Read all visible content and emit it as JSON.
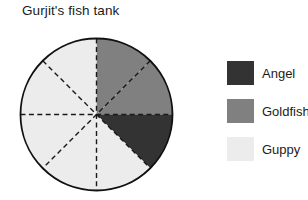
{
  "chart_data": {
    "type": "pie",
    "title": "Gurjit's fish tank",
    "categories": [
      "Angel",
      "Goldfish",
      "Guppy"
    ],
    "values": [
      1,
      2,
      5
    ],
    "total_slices": 8,
    "slice_angle_degrees": 45,
    "fractions": [
      "1/8",
      "2/8",
      "5/8"
    ],
    "colors": [
      "#333333",
      "#808080",
      "#ececec"
    ],
    "outline_color": "#111111",
    "divider_style": "dashed",
    "divider_color": "#1a1a1a",
    "legend_position": "right",
    "grid": false,
    "slices": [
      {
        "label": "Guppy",
        "start_deg": 270,
        "end_deg": 315,
        "color": "#ececec"
      },
      {
        "label": "Goldfish",
        "start_deg": 315,
        "end_deg": 0,
        "color": "#808080"
      },
      {
        "label": "Goldfish",
        "start_deg": 0,
        "end_deg": 45,
        "color": "#808080"
      },
      {
        "label": "Angel",
        "start_deg": 45,
        "end_deg": 90,
        "color": "#333333"
      },
      {
        "label": "Guppy",
        "start_deg": 90,
        "end_deg": 135,
        "color": "#ececec"
      },
      {
        "label": "Guppy",
        "start_deg": 135,
        "end_deg": 180,
        "color": "#ececec"
      },
      {
        "label": "Guppy",
        "start_deg": 180,
        "end_deg": 225,
        "color": "#ececec"
      },
      {
        "label": "Guppy",
        "start_deg": 225,
        "end_deg": 270,
        "color": "#ececec"
      }
    ]
  },
  "title": {
    "text": "Gurjit's fish tank"
  },
  "legend": {
    "items": [
      {
        "label": "Angel",
        "color": "#333333"
      },
      {
        "label": "Goldfish",
        "color": "#808080"
      },
      {
        "label": "Guppy",
        "color": "#ececec"
      }
    ]
  }
}
